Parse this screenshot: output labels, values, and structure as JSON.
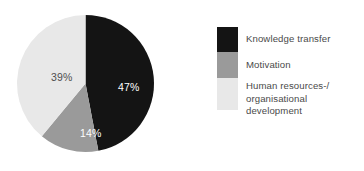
{
  "chart_data": {
    "type": "pie",
    "title": "",
    "subtitle": "",
    "xlabel": "",
    "ylabel": "",
    "legend_position": "right",
    "grid": false,
    "units": "percent",
    "categories": [
      "Knowledge transfer",
      "Motivation",
      "Human resources-/ organisational development"
    ],
    "values": [
      47,
      14,
      39
    ],
    "labels": [
      "47%",
      "14%",
      "39%"
    ],
    "colors": [
      "#141414",
      "#9a9a9a",
      "#e8e8e8"
    ],
    "slices": [
      {
        "name": "Knowledge transfer",
        "value": 47,
        "label": "47%",
        "color": "#141414",
        "label_color": "#ffffff",
        "start_angle_deg": 0,
        "end_angle_deg": 169.2
      },
      {
        "name": "Motivation",
        "value": 14,
        "label": "14%",
        "color": "#9a9a9a",
        "label_color": "#ffffff",
        "start_angle_deg": 169.2,
        "end_angle_deg": 219.6
      },
      {
        "name": "Human resources-/ organisational development",
        "value": 39,
        "label": "39%",
        "color": "#e8e8e8",
        "label_color": "#4e4e4e",
        "start_angle_deg": 219.6,
        "end_angle_deg": 360
      }
    ]
  },
  "legend": {
    "items": [
      {
        "label": "Knowledge transfer",
        "label_line2": "",
        "swatch_color": "#141414",
        "swatch_name": "legend-swatch-knowledge-transfer"
      },
      {
        "label": "Motivation",
        "label_line2": "",
        "swatch_color": "#9a9a9a",
        "swatch_name": "legend-swatch-motivation"
      },
      {
        "label": "Human resources-/",
        "label_line2": "organisational development",
        "swatch_color": "#e8e8e8",
        "swatch_name": "legend-swatch-human-resources"
      }
    ]
  },
  "theme": {
    "background": "#ffffff",
    "text_color": "#4a4a4a",
    "dark": "#141414",
    "mid_gray": "#9a9a9a",
    "light_gray": "#e8e8e8"
  }
}
